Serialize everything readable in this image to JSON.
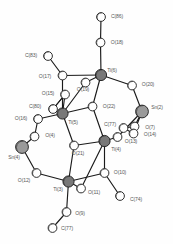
{
  "figure": {
    "kind": "ortep-crystal-structure-diagram",
    "title": "",
    "background_color": "#fefefe",
    "label_color": "#5a5a5a",
    "bond_color": "#1a1a1a",
    "atom_styles": {
      "oxygen": {
        "fill": "#ffffff",
        "stroke": "#1a1a1a",
        "radius": 4.4
      },
      "carbon": {
        "fill": "#ffffff",
        "stroke": "#1a1a1a",
        "radius": 4.4
      },
      "titanium": {
        "fill": "#787878",
        "stroke": "#1a1a1a",
        "radius": 5.6
      },
      "tin": {
        "fill": "#9a9a9a",
        "stroke": "#1a1a1a",
        "radius": 6.4
      }
    },
    "atoms": [
      {
        "id": "C86",
        "label": "C(86)",
        "element": "carbon",
        "cx": 101.0,
        "cy": 17.0,
        "lx": 117.0,
        "ly": 17.0
      },
      {
        "id": "O18",
        "label": "O(18)",
        "element": "oxygen",
        "cx": 100.5,
        "cy": 42.5,
        "lx": 117.0,
        "ly": 42.5
      },
      {
        "id": "C83",
        "label": "C(83)",
        "element": "carbon",
        "cx": 48.0,
        "cy": 56.0,
        "lx": 31.0,
        "ly": 56.0
      },
      {
        "id": "O17",
        "label": "O(17)",
        "element": "oxygen",
        "cx": 62.5,
        "cy": 75.5,
        "lx": 45.0,
        "ly": 77.0
      },
      {
        "id": "Ti6",
        "label": "Ti(6)",
        "element": "titanium",
        "cx": 101.0,
        "cy": 75.0,
        "lx": 112.0,
        "ly": 70.5
      },
      {
        "id": "O19",
        "label": "O(19)",
        "element": "oxygen",
        "cx": 85.5,
        "cy": 82.5,
        "lx": 83.0,
        "ly": 90.0
      },
      {
        "id": "O20",
        "label": "O(20)",
        "element": "oxygen",
        "cx": 132.0,
        "cy": 85.5,
        "lx": 148.0,
        "ly": 85.0
      },
      {
        "id": "O15",
        "label": "O(15)",
        "element": "oxygen",
        "cx": 65.0,
        "cy": 94.5,
        "lx": 48.0,
        "ly": 93.5
      },
      {
        "id": "C80",
        "label": "C(80)",
        "element": "carbon",
        "cx": 53.0,
        "cy": 109.0,
        "lx": 35.0,
        "ly": 107.0
      },
      {
        "id": "O22",
        "label": "O(22)",
        "element": "oxygen",
        "cx": 92.5,
        "cy": 106.5,
        "lx": 109.0,
        "ly": 107.0
      },
      {
        "id": "Ti5",
        "label": "Ti(5)",
        "element": "titanium",
        "cx": 62.5,
        "cy": 113.5,
        "lx": 73.0,
        "ly": 122.5
      },
      {
        "id": "Sn2",
        "label": "Sn(2)",
        "element": "tin",
        "cx": 142.0,
        "cy": 111.5,
        "lx": 157.0,
        "ly": 108.0
      },
      {
        "id": "O16",
        "label": "O(16)",
        "element": "oxygen",
        "cx": 38.0,
        "cy": 119.0,
        "lx": 21.0,
        "ly": 119.0
      },
      {
        "id": "C77",
        "label": "C(77)",
        "element": "carbon",
        "cx": 123.5,
        "cy": 128.0,
        "lx": 110.0,
        "ly": 124.5
      },
      {
        "id": "O7",
        "label": "O(7)",
        "element": "oxygen",
        "cx": 134.5,
        "cy": 126.5,
        "lx": 150.0,
        "ly": 127.5
      },
      {
        "id": "O14",
        "label": "O(14)",
        "element": "oxygen",
        "cx": 133.5,
        "cy": 133.5,
        "lx": 150.0,
        "ly": 134.5
      },
      {
        "id": "O4",
        "label": "O(4)",
        "element": "oxygen",
        "cx": 34.5,
        "cy": 136.5,
        "lx": 50.0,
        "ly": 136.0
      },
      {
        "id": "O13",
        "label": "O(13)",
        "element": "oxygen",
        "cx": 117.5,
        "cy": 137.0,
        "lx": 131.0,
        "ly": 142.0
      },
      {
        "id": "Ti4",
        "label": "Ti(4)",
        "element": "titanium",
        "cx": 104.5,
        "cy": 141.0,
        "lx": 116.0,
        "ly": 150.0
      },
      {
        "id": "Sn4",
        "label": "Sn(4)",
        "element": "tin",
        "cx": 22.0,
        "cy": 147.0,
        "lx": 14.0,
        "ly": 158.0
      },
      {
        "id": "O21",
        "label": "O(21)",
        "element": "oxygen",
        "cx": 74.0,
        "cy": 145.5,
        "lx": 78.0,
        "ly": 153.5
      },
      {
        "id": "O12",
        "label": "O(12)",
        "element": "oxygen",
        "cx": 36.5,
        "cy": 173.0,
        "lx": 24.0,
        "ly": 180.5
      },
      {
        "id": "O10",
        "label": "O(10)",
        "element": "oxygen",
        "cx": 104.5,
        "cy": 173.0,
        "lx": 120.0,
        "ly": 173.0
      },
      {
        "id": "Ti3",
        "label": "Ti(3)",
        "element": "titanium",
        "cx": 68.5,
        "cy": 181.5,
        "lx": 58.0,
        "ly": 190.0
      },
      {
        "id": "O11",
        "label": "O(11)",
        "element": "oxygen",
        "cx": 81.0,
        "cy": 188.5,
        "lx": 94.0,
        "ly": 193.0
      },
      {
        "id": "C74",
        "label": "C(74)",
        "element": "carbon",
        "cx": 120.0,
        "cy": 196.0,
        "lx": 136.0,
        "ly": 200.0
      },
      {
        "id": "O9",
        "label": "O(9)",
        "element": "oxygen",
        "cx": 66.5,
        "cy": 212.0,
        "lx": 80.0,
        "ly": 213.5
      },
      {
        "id": "C77b",
        "label": "C(77)",
        "element": "carbon",
        "cx": 52.5,
        "cy": 228.0,
        "lx": 67.0,
        "ly": 228.5
      }
    ],
    "bonds": [
      [
        "C86",
        "O18"
      ],
      [
        "O18",
        "Ti6"
      ],
      [
        "C83",
        "O17"
      ],
      [
        "O17",
        "Ti5"
      ],
      [
        "O17",
        "Ti6"
      ],
      [
        "Ti6",
        "O19"
      ],
      [
        "Ti6",
        "O20"
      ],
      [
        "Ti6",
        "O22"
      ],
      [
        "O19",
        "Ti5"
      ],
      [
        "O20",
        "Sn2"
      ],
      [
        "O15",
        "Ti5"
      ],
      [
        "O15",
        "C80"
      ],
      [
        "C80",
        "O15"
      ],
      [
        "O22",
        "Ti5"
      ],
      [
        "O22",
        "Ti4"
      ],
      [
        "Ti5",
        "O16"
      ],
      [
        "Ti5",
        "O21"
      ],
      [
        "O16",
        "O4"
      ],
      [
        "Sn2",
        "O7"
      ],
      [
        "Sn2",
        "O14"
      ],
      [
        "C77",
        "O7"
      ],
      [
        "C77",
        "O14"
      ],
      [
        "O4",
        "Sn4"
      ],
      [
        "O13",
        "Ti4"
      ],
      [
        "O13",
        "Sn2"
      ],
      [
        "Ti4",
        "O21"
      ],
      [
        "Ti4",
        "O10"
      ],
      [
        "Ti4",
        "O11"
      ],
      [
        "Sn4",
        "O12"
      ],
      [
        "O21",
        "Ti3"
      ],
      [
        "O12",
        "Ti3"
      ],
      [
        "O10",
        "Ti3"
      ],
      [
        "O10",
        "C74"
      ],
      [
        "Ti3",
        "O11"
      ],
      [
        "Ti3",
        "O9"
      ],
      [
        "O9",
        "C77b"
      ]
    ]
  }
}
